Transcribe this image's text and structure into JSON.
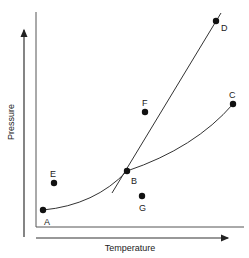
{
  "diagram": {
    "type": "phase-diagram",
    "axes": {
      "x_label": "Temperature",
      "y_label": "Pressure"
    },
    "points": [
      {
        "id": "A",
        "label": "A",
        "x": 43,
        "y": 210,
        "lx": 47,
        "ly": 225
      },
      {
        "id": "B",
        "label": "B",
        "x": 127,
        "y": 171,
        "lx": 134,
        "ly": 183
      },
      {
        "id": "C",
        "label": "C",
        "x": 233,
        "y": 104,
        "lx": 232,
        "ly": 98
      },
      {
        "id": "D",
        "label": "D",
        "x": 216,
        "y": 21,
        "lx": 224,
        "ly": 31
      },
      {
        "id": "E",
        "label": "E",
        "x": 54,
        "y": 183,
        "lx": 53,
        "ly": 177
      },
      {
        "id": "F",
        "label": "F",
        "x": 145,
        "y": 112,
        "lx": 144,
        "ly": 106
      },
      {
        "id": "G",
        "label": "G",
        "x": 142,
        "y": 196,
        "lx": 142,
        "ly": 211
      }
    ],
    "curves": [
      {
        "name": "sublimation-curve",
        "from": "A",
        "to": "B"
      },
      {
        "name": "vaporization-curve",
        "from": "B",
        "to": "C"
      },
      {
        "name": "fusion-line",
        "from": "B",
        "to": "D"
      }
    ],
    "colors": {
      "line": "#333333",
      "point": "#111111"
    }
  }
}
